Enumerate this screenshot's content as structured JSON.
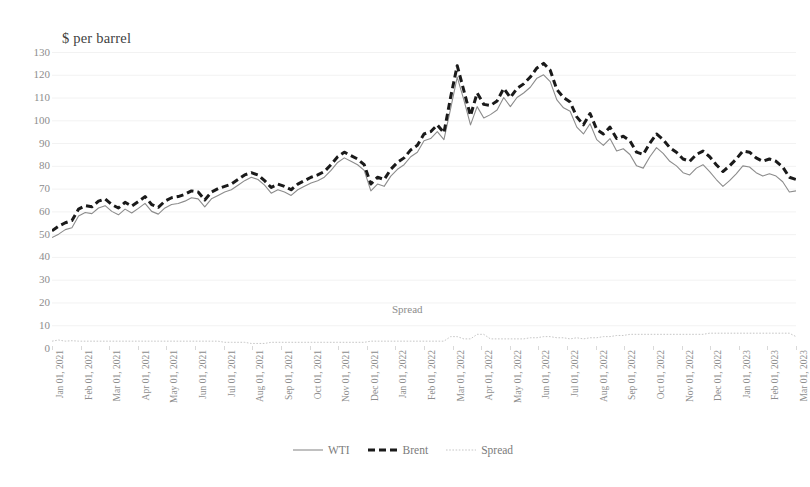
{
  "chart_data": {
    "type": "line",
    "title": "",
    "ylabel": "$ per barrel",
    "xlabel": "",
    "ylim": [
      0,
      130
    ],
    "yticks": [
      130,
      120,
      110,
      100,
      90,
      80,
      70,
      60,
      50,
      40,
      30,
      20,
      10,
      0
    ],
    "grid": true,
    "legend_position": "bottom",
    "annotations": [
      {
        "text": "Spread",
        "x": "2022-02-15",
        "y": 13
      }
    ],
    "xtick_labels": [
      "Jan 01, 2021",
      "Feb 01, 2021",
      "Mar 01, 2021",
      "Apr 01, 2021",
      "May 01, 2021",
      "Jun 01, 2021",
      "Jul 01, 2021",
      "Aug 01, 2021",
      "Sep 01, 2021",
      "Oct 01, 2021",
      "Nov 01, 2021",
      "Dec 01, 2021",
      "Jan 01, 2022",
      "Feb 01, 2022",
      "Mar 01, 2022",
      "Apr 01, 2022",
      "May 01, 2022",
      "Jun 01, 2022",
      "Jul 01, 2022",
      "Aug 01, 2022",
      "Sep 01, 2022",
      "Oct 01, 2022",
      "Nov 01, 2022",
      "Dec 01, 2022",
      "Jan 01, 2023",
      "Feb 01, 2023",
      "Mar 01, 2023"
    ],
    "series": [
      {
        "name": "WTI",
        "style": "solid-thin",
        "color": "#8c8c8c",
        "values": [
          48.5,
          50.0,
          52.0,
          52.8,
          58.0,
          59.5,
          59.0,
          61.5,
          62.5,
          60.0,
          58.5,
          61.0,
          59.3,
          61.3,
          63.5,
          60.0,
          58.8,
          61.5,
          63.0,
          63.5,
          64.5,
          66.0,
          65.5,
          62.0,
          65.5,
          67.0,
          68.5,
          69.5,
          71.5,
          73.5,
          75.0,
          74.0,
          71.5,
          68.0,
          69.5,
          68.5,
          67.0,
          69.5,
          71.0,
          72.5,
          73.5,
          75.0,
          78.0,
          81.5,
          83.5,
          82.0,
          80.5,
          78.0,
          69.0,
          72.0,
          71.0,
          75.5,
          78.5,
          80.5,
          84.0,
          86.0,
          91.0,
          92.0,
          95.0,
          91.5,
          105.0,
          119.0,
          109.0,
          98.0,
          106.0,
          101.0,
          102.5,
          104.5,
          110.0,
          106.0,
          110.0,
          112.0,
          114.5,
          118.5,
          120.0,
          117.0,
          109.0,
          105.5,
          104.0,
          97.0,
          94.0,
          98.5,
          91.5,
          89.0,
          92.0,
          86.5,
          87.5,
          85.0,
          80.0,
          79.0,
          84.0,
          88.0,
          85.5,
          82.0,
          80.0,
          77.0,
          76.0,
          79.0,
          80.5,
          77.5,
          74.0,
          71.0,
          73.5,
          76.5,
          80.0,
          79.5,
          77.0,
          75.5,
          76.5,
          75.5,
          73.0,
          68.5,
          69.0
        ]
      },
      {
        "name": "Brent",
        "style": "dashed-thick",
        "color": "#1a1a1a",
        "values": [
          51.5,
          53.5,
          55.0,
          56.0,
          61.0,
          62.5,
          62.0,
          64.5,
          65.5,
          63.0,
          61.5,
          64.0,
          62.3,
          64.3,
          66.5,
          63.0,
          61.8,
          64.5,
          66.0,
          66.5,
          67.5,
          69.0,
          68.5,
          65.0,
          68.5,
          70.0,
          71.0,
          72.0,
          74.0,
          76.0,
          77.0,
          76.0,
          73.5,
          70.5,
          72.0,
          71.0,
          69.5,
          72.0,
          73.5,
          75.0,
          76.0,
          77.5,
          80.5,
          84.0,
          86.0,
          84.5,
          83.0,
          80.5,
          72.0,
          75.0,
          74.0,
          78.5,
          81.5,
          83.5,
          87.0,
          89.0,
          94.0,
          95.0,
          98.0,
          94.5,
          110.0,
          124.0,
          113.0,
          102.0,
          112.0,
          107.0,
          106.5,
          108.5,
          114.0,
          110.0,
          114.0,
          116.0,
          119.0,
          123.0,
          125.0,
          122.0,
          113.5,
          110.0,
          108.0,
          101.5,
          98.0,
          103.0,
          96.0,
          94.0,
          97.0,
          92.0,
          93.0,
          91.0,
          86.0,
          85.0,
          90.0,
          94.0,
          91.5,
          88.0,
          86.0,
          83.0,
          82.0,
          85.0,
          86.5,
          84.0,
          80.5,
          77.5,
          80.0,
          83.0,
          86.5,
          86.0,
          83.5,
          82.0,
          83.0,
          82.0,
          79.5,
          75.0,
          74.0
        ]
      },
      {
        "name": "Spread",
        "style": "dotted",
        "color": "#bfbfbf",
        "values": [
          3.0,
          3.5,
          3.0,
          3.2,
          3.0,
          3.0,
          3.0,
          3.0,
          3.0,
          3.0,
          3.0,
          3.0,
          3.0,
          3.0,
          3.0,
          3.0,
          3.0,
          3.0,
          3.0,
          3.0,
          3.0,
          3.0,
          3.0,
          3.0,
          3.0,
          3.0,
          2.5,
          2.5,
          2.5,
          2.5,
          2.0,
          2.0,
          2.0,
          2.5,
          2.5,
          2.5,
          2.5,
          2.5,
          2.5,
          2.5,
          2.5,
          2.5,
          2.5,
          2.5,
          2.5,
          2.5,
          2.5,
          2.5,
          3.0,
          3.0,
          3.0,
          3.0,
          3.0,
          3.0,
          3.0,
          3.0,
          3.0,
          3.0,
          3.0,
          3.0,
          5.0,
          5.0,
          4.0,
          4.0,
          6.0,
          6.0,
          4.0,
          4.0,
          4.0,
          4.0,
          4.0,
          4.0,
          4.5,
          4.5,
          5.0,
          5.0,
          4.5,
          4.5,
          4.0,
          4.5,
          4.0,
          4.5,
          4.5,
          5.0,
          5.0,
          5.5,
          5.5,
          6.0,
          6.0,
          6.0,
          6.0,
          6.0,
          6.0,
          6.0,
          6.0,
          6.0,
          6.0,
          6.0,
          6.0,
          6.5,
          6.5,
          6.5,
          6.5,
          6.5,
          6.5,
          6.5,
          6.5,
          6.5,
          6.5,
          6.5,
          6.5,
          6.5,
          5.0
        ]
      }
    ]
  },
  "legend": {
    "items": [
      {
        "label": "WTI"
      },
      {
        "label": "Brent"
      },
      {
        "label": "Spread"
      }
    ]
  }
}
